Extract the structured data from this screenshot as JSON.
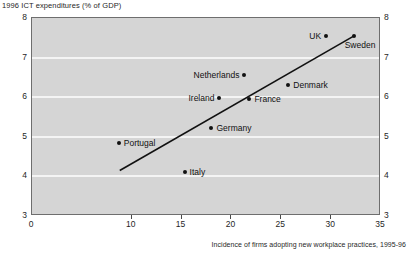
{
  "chart_data": {
    "type": "scatter",
    "title": "1996 ICT expenditures (% of GDP)",
    "xlabel": "Incidence of firms adopting new workplace practices, 1995-96",
    "ylabel": "1996 ICT expenditures (% of GDP)",
    "xlim": [
      0,
      35
    ],
    "ylim": [
      3,
      8
    ],
    "xticks": [
      0,
      10,
      15,
      20,
      25,
      30,
      35
    ],
    "xtick_labels": [
      "0",
      "10",
      "15",
      "20",
      "25",
      "30",
      "35"
    ],
    "yticks": [
      3,
      4,
      5,
      6,
      7,
      8
    ],
    "ytick_labels": [
      "3",
      "4",
      "5",
      "6",
      "7",
      "8"
    ],
    "y_axis_right": true,
    "grid": "horizontal-white",
    "legend": "none",
    "plot_background": "#d5d5d5",
    "marker_color": "#111111",
    "trendline": {
      "label": "linear fit",
      "x0": 8.8,
      "y0": 4.15,
      "x1": 32.3,
      "y1": 7.55,
      "color": "#111111"
    },
    "points": [
      {
        "label": "Portugal",
        "x": 8.7,
        "y": 4.85,
        "label_pos": "right"
      },
      {
        "label": "Italy",
        "x": 15.3,
        "y": 4.12,
        "label_pos": "right"
      },
      {
        "label": "Germany",
        "x": 18.0,
        "y": 5.22,
        "label_pos": "right"
      },
      {
        "label": "Ireland",
        "x": 18.8,
        "y": 5.97,
        "label_pos": "left"
      },
      {
        "label": "Netherlands",
        "x": 21.3,
        "y": 6.57,
        "label_pos": "left"
      },
      {
        "label": "France",
        "x": 21.8,
        "y": 5.95,
        "label_pos": "right"
      },
      {
        "label": "Denmark",
        "x": 25.7,
        "y": 6.3,
        "label_pos": "right"
      },
      {
        "label": "UK",
        "x": 29.5,
        "y": 7.55,
        "label_pos": "left"
      },
      {
        "label": "Sweden",
        "x": 32.3,
        "y": 7.55,
        "label_pos": "below"
      }
    ]
  }
}
